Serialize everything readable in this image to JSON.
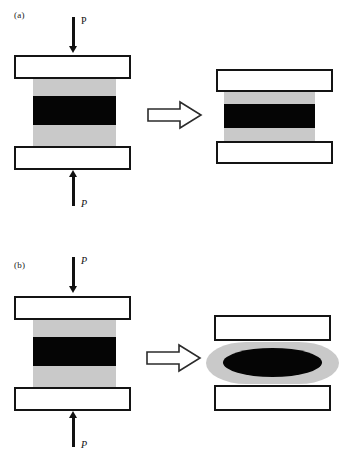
{
  "figure": {
    "type": "technical-diagram",
    "background_color": "#ffffff",
    "ink_color": "#141414",
    "specimen_gray": "#c9c9c9",
    "specimen_core_black": "#050505",
    "width_px": 351,
    "height_px": 469
  },
  "panels": [
    {
      "id": "a",
      "label": "(a)",
      "description": "uniform (frictionless) compression - specimen shortens and widens uniformly",
      "top_load_label": "P",
      "top_load_label_style": "upright",
      "bottom_load_label": "P",
      "bottom_load_label_style": "italic",
      "top_arrow_direction": "down",
      "bottom_arrow_direction": "up",
      "transition_arrow": "block-arrow-right",
      "before": {
        "name": "undeformed-specimen",
        "shape": "rectangular",
        "bands": [
          "gray",
          "black",
          "gray"
        ]
      },
      "after": {
        "name": "deformed-specimen",
        "shape": "rectangular",
        "bands": [
          "gray",
          "black",
          "gray"
        ]
      }
    },
    {
      "id": "b",
      "label": "(b)",
      "description": "constrained (friction) compression - specimen barrels and core becomes elliptical",
      "top_load_label": "P",
      "top_load_label_style": "italic",
      "bottom_load_label": "P",
      "bottom_load_label_style": "italic",
      "top_arrow_direction": "down",
      "bottom_arrow_direction": "up",
      "transition_arrow": "block-arrow-right",
      "before": {
        "name": "undeformed-specimen",
        "shape": "rectangular",
        "bands": [
          "gray",
          "black",
          "gray"
        ]
      },
      "after": {
        "name": "barrelled-specimen",
        "shape": "barrel",
        "bands": [
          "gray",
          "black-ellipse",
          "gray"
        ]
      }
    }
  ],
  "caption": {
    "text": "",
    "visible": false
  }
}
